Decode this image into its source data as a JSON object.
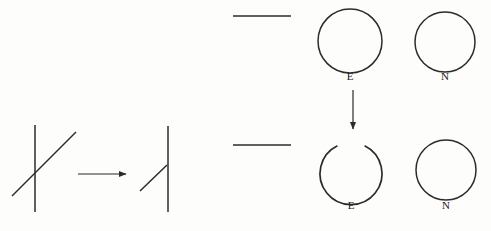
{
  "figure": {
    "background_color": "#fdfdfc",
    "stroke_color": "#2b2b2b",
    "width": 491,
    "height": 231
  },
  "panels": {
    "left": {
      "name": "line-junction-transformation",
      "source_shape": {
        "name": "crossing-lines-x",
        "vertical_line": {
          "x": 35,
          "y1": 125,
          "y2": 212
        },
        "diagonal_line": {
          "x1": 12,
          "y1": 196,
          "x2": 76,
          "y2": 132
        }
      },
      "arrow": {
        "x1": 78,
        "y1": 174,
        "x2": 128,
        "y2": 174,
        "direction": "right"
      },
      "result_shape": {
        "name": "tee-junction",
        "vertical_line": {
          "x": 168,
          "y1": 126,
          "y2": 212
        },
        "diagonal_line": {
          "x1": 140,
          "y1": 191,
          "x2": 167,
          "y2": 165
        }
      }
    },
    "right": {
      "name": "closure-transformation",
      "top_row": {
        "rule_line": {
          "x1": 233,
          "y1": 16,
          "x2": 291,
          "y2": 16
        },
        "shapes": [
          {
            "name": "closed-circle-e",
            "type": "circle",
            "cx": 350,
            "cy": 41,
            "r": 32,
            "label": "E",
            "label_x": 350,
            "label_y": 77
          },
          {
            "name": "closed-circle-n",
            "type": "circle",
            "cx": 445,
            "cy": 42,
            "r": 30,
            "label": "N",
            "label_x": 445,
            "label_y": 77
          }
        ]
      },
      "arrow": {
        "x": 353,
        "y1": 90,
        "y2": 131,
        "direction": "down"
      },
      "bottom_row": {
        "rule_line": {
          "x1": 233,
          "y1": 145,
          "x2": 291,
          "y2": 145
        },
        "shapes": [
          {
            "name": "open-arc-e",
            "type": "arc",
            "cx": 351,
            "cy": 170,
            "r": 31,
            "gap_degrees": 52,
            "gap_orientation": "top",
            "label": "E",
            "label_x": 351,
            "label_y": 206
          },
          {
            "name": "closed-circle-n",
            "type": "circle",
            "cx": 446,
            "cy": 170,
            "r": 30,
            "label": "N",
            "label_x": 446,
            "label_y": 206
          }
        ]
      }
    }
  },
  "labels": {
    "top_circle_e": "E",
    "top_circle_n": "N",
    "bottom_arc_e": "E",
    "bottom_circle_n": "N"
  }
}
